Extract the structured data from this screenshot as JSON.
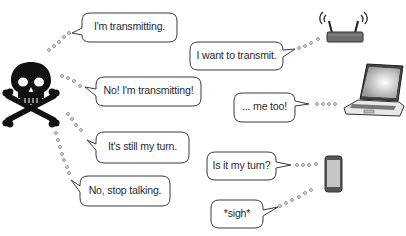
{
  "diagram": {
    "interferer": {
      "icon": "skull-crossbones-icon",
      "color": "#111111"
    },
    "devices": [
      {
        "name": "router",
        "icon": "wireless-router-icon"
      },
      {
        "name": "laptop",
        "icon": "laptop-icon"
      },
      {
        "name": "phone",
        "icon": "smartphone-icon"
      }
    ],
    "bubbles": {
      "skull_1": "I'm transmitting.",
      "skull_2": "No! I'm transmitting!",
      "skull_3": "It's still my turn.",
      "skull_4": "No, stop talking.",
      "router_1": "I want to transmit.",
      "laptop_1": "... me too!",
      "phone_1": "Is it my turn?",
      "phone_2": "*sigh*"
    },
    "colors": {
      "bubble_border": "#3a3a3a",
      "dot_border": "#8a8a8a",
      "device_gray": "#6a6a6a",
      "phone_screen": "#c4c4c4"
    }
  }
}
